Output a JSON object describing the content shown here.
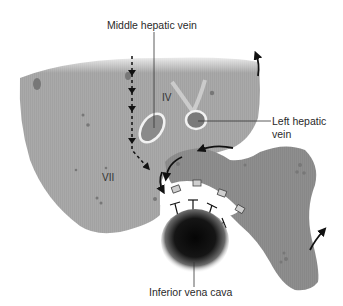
{
  "diagram": {
    "type": "anatomical-illustration",
    "labels": {
      "middle_hepatic_vein": "Middle hepatic vein",
      "left_hepatic_vein_line1": "Left hepatic",
      "left_hepatic_vein_line2": "vein",
      "inferior_vena_cava": "Inferior vena cava"
    },
    "segments": {
      "iv": "IV",
      "vii": "VII"
    },
    "colors": {
      "right_lobe": "#a9a9a9",
      "left_lobe": "#8e8e8e",
      "vein_outline": "#f0f0f0",
      "ivc": "#111111",
      "arrow": "#111111",
      "text": "#2a2a2a"
    }
  }
}
